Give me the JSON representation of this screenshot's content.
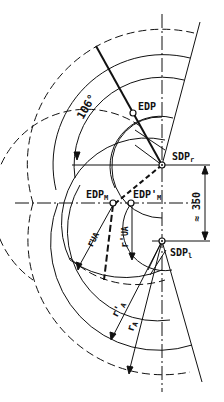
{
  "labels": {
    "edp": "EDP",
    "sdp_r": "SDP",
    "sdp_r_sub": "r",
    "sdp_l": "SDP",
    "sdp_l_sub": "l",
    "edp_m": "EDP",
    "edp_m_sub": "M",
    "edp_m_prime": "EDP'",
    "edp_m_prime_sub": "M",
    "angle": "106°",
    "distance": "≈ 350",
    "r_ua": "r",
    "r_ua_sub": "UA",
    "r_ua_prime": "r'",
    "r_ua_prime_sub": "UA",
    "r_a": "r",
    "r_a_sub": "A",
    "r_a_prime": "r'",
    "r_a_prime_sub": "A"
  },
  "colors": {
    "line": "#111111",
    "background": "#ffffff"
  }
}
